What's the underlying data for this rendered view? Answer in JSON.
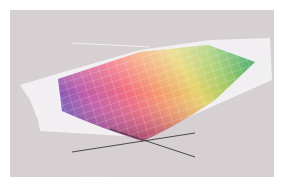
{
  "figure": {
    "type": "3d-color-gamut-comparison",
    "background_color": "#d6d0d3",
    "outer_gamut": {
      "label": "",
      "fill": "#f4f2f4",
      "wire_color": "#ffffff"
    },
    "inner_gamut": {
      "label": "",
      "gradient_stops": [
        "#7a5ab8",
        "#d86aa8",
        "#f0707a",
        "#f6a070",
        "#e8d870",
        "#9ac860",
        "#3aa050"
      ],
      "wire_color": "#ffffff"
    },
    "axes": {
      "color": "#3a3a3a"
    },
    "caption": ". . . . ."
  }
}
